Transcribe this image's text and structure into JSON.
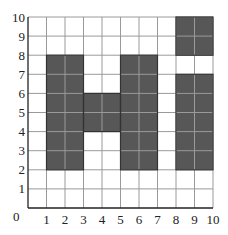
{
  "chart_data": {
    "type": "heatmap",
    "title": "",
    "xlabel": "",
    "ylabel": "",
    "xlim": [
      0,
      10
    ],
    "ylim": [
      0,
      10
    ],
    "grid": true,
    "x_ticks": [
      "1",
      "2",
      "3",
      "4",
      "5",
      "6",
      "7",
      "8",
      "9",
      "10"
    ],
    "y_ticks": [
      "1",
      "2",
      "3",
      "4",
      "5",
      "6",
      "7",
      "8",
      "9",
      "10"
    ],
    "origin_label": "0",
    "shaded_rectangles": [
      {
        "name": "H-left-column",
        "x0": 1,
        "x1": 3,
        "y0": 2,
        "y1": 8
      },
      {
        "name": "H-crossbar",
        "x0": 3,
        "x1": 5,
        "y0": 4,
        "y1": 6
      },
      {
        "name": "H-right-column",
        "x0": 5,
        "x1": 7,
        "y0": 2,
        "y1": 8
      },
      {
        "name": "i-dot",
        "x0": 8,
        "x1": 10,
        "y0": 8,
        "y1": 10
      },
      {
        "name": "i-stem",
        "x0": 8,
        "x1": 10,
        "y0": 2,
        "y1": 7
      }
    ],
    "depicts_text": "Hi"
  },
  "colors": {
    "shade": "#575757",
    "shade_grid": "#444444",
    "grid": "#9a9a9a",
    "axis": "#222222",
    "outline": "#333333"
  }
}
